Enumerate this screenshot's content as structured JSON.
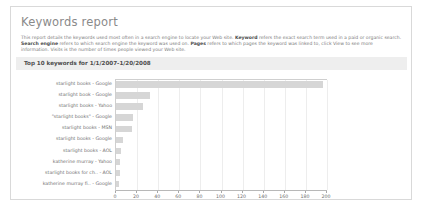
{
  "report": {
    "title": "Keywords report",
    "description_segments": [
      {
        "text": "This report details the keywords used most often in a search engine to locate your Web site. ",
        "bold": false
      },
      {
        "text": "Keyword",
        "bold": true
      },
      {
        "text": " refers the exact search term used in a paid or organic search. ",
        "bold": false
      },
      {
        "text": "Search engine",
        "bold": true
      },
      {
        "text": " refers to which search engine the keyword was used on. ",
        "bold": false
      },
      {
        "text": "Pages",
        "bold": true
      },
      {
        "text": " refers to which pages the keyword was linked to, click View to see more information. Visits is the number of times people viewed your Web site.",
        "bold": false
      }
    ],
    "section_header": "Top 10 keywords for 1/1/2007-1/20/2008"
  },
  "chart_data": {
    "type": "bar",
    "orientation": "horizontal",
    "title": "Top 10 keywords for 1/1/2007-1/20/2008",
    "xlabel": "",
    "ylabel": "",
    "xlim": [
      0,
      200
    ],
    "grid": true,
    "legend": false,
    "xticks": [
      0,
      20,
      40,
      60,
      80,
      100,
      120,
      140,
      160,
      180,
      200
    ],
    "xtick_labels": [
      "0",
      "20",
      "40",
      "60",
      "80",
      "100",
      "120",
      "140",
      "160",
      "180",
      "200"
    ],
    "categories": [
      "starlight books - Google",
      "starlight book - Google",
      "starlight books - Yahoo",
      "\"starlight books\" - Google",
      "starlight books - MSN",
      "starlight books - Google",
      "starlight books - AOL",
      "katherine murray - Yahoo",
      "starlight books for ch.. - AOL",
      "katherine murray fi.. - Google"
    ],
    "values": [
      196,
      32,
      26,
      16,
      15,
      7,
      5,
      4,
      4,
      3
    ],
    "bar_color": "#d6d6d6"
  },
  "colors": {
    "panel_border": "#d9d9d9",
    "header_band": "#eeeeee",
    "bar": "#d6d6d6",
    "text": "#6f6f6f",
    "title": "#8a8a8a"
  }
}
